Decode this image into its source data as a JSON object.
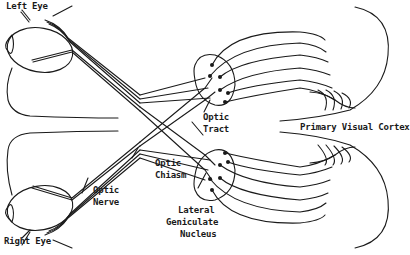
{
  "diagram": {
    "labels": {
      "left_eye": "Left Eye",
      "right_eye": "Right Eye",
      "optic_nerve": [
        "Optic",
        "Nerve"
      ],
      "optic_chiasm": [
        "Optic",
        "Chiasm"
      ],
      "optic_tract": [
        "Optic",
        "Tract"
      ],
      "lateral_geniculate_nucleus": [
        "Lateral",
        "Geniculate",
        "Nucleus"
      ],
      "primary_visual_cortex": "Primary Visual Cortex"
    },
    "colors": {
      "line": "#1a1a1a",
      "background": "#ffffff"
    }
  }
}
